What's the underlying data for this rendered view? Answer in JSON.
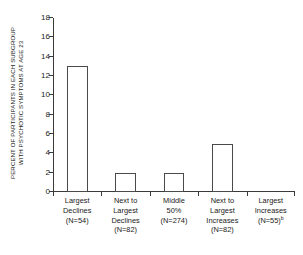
{
  "chart_data": {
    "type": "bar",
    "title": "",
    "xlabel": "",
    "ylabel": "PERCENT OF PARTICIPANTS IN EACH SUBGROUP WITH PSYCHOTIC SYMPTOMS AT AGE 23",
    "ylabel_lines": [
      "PERCENT OF PARTICIPANTS IN EACH SUBGROUP",
      "WITH PSYCHOTIC SYMPTOMS AT AGE 23"
    ],
    "categories": [
      "Largest Declines (N=54)",
      "Next to Largest Declines (N=82)",
      "Middle 50% (N=274)",
      "Next to Largest Increases (N=82)",
      "Largest Increases (N=55)"
    ],
    "category_lines": [
      [
        "Largest",
        "Declines",
        "(N=54)"
      ],
      [
        "Next to",
        "Largest",
        "Declines",
        "(N=82)"
      ],
      [
        "Middle",
        "50%",
        "(N=274)"
      ],
      [
        "Next to",
        "Largest",
        "Increases",
        "(N=82)"
      ],
      [
        "Largest",
        "Increases",
        "(N=55)"
      ]
    ],
    "category_footnotes": [
      "",
      "",
      "",
      "",
      "b"
    ],
    "values": [
      13,
      2,
      2,
      5,
      0
    ],
    "ylim": [
      0,
      18
    ],
    "yticks": [
      0,
      2,
      4,
      6,
      8,
      10,
      12,
      14,
      16,
      18
    ],
    "ytick_labels": [
      "0",
      "2",
      "4",
      "6",
      "8",
      "10",
      "12",
      "14",
      "16",
      "18"
    ],
    "grid": false,
    "legend": null,
    "bar_fill": "#ffffff",
    "bar_edge": "#4a4a4a",
    "axis_color": "#3a3a3a",
    "background": "#ffffff"
  }
}
